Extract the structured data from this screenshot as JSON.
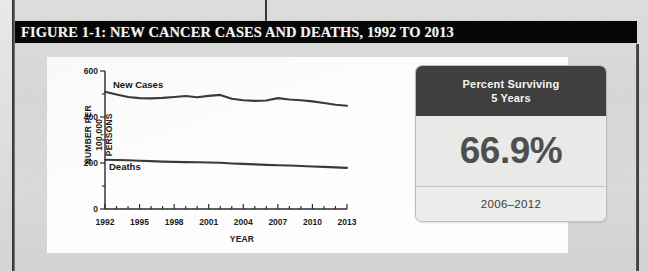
{
  "figure": {
    "title": "FIGURE 1-1: NEW CANCER CASES AND DEATHS, 1992 TO 2013"
  },
  "survival_card": {
    "header_line1": "Percent Surviving",
    "header_line2": "5 Years",
    "value": "66.9%",
    "period": "2006–2012"
  },
  "chart_data": {
    "type": "line",
    "title": "",
    "xlabel": "YEAR",
    "ylabel": "NUMBER PER 100,000 PERSONS",
    "ylim": [
      0,
      600
    ],
    "yticks": [
      0,
      200,
      400,
      600
    ],
    "ytick_labels": [
      "0",
      "200",
      "400",
      "600"
    ],
    "xlim": [
      1992,
      2013
    ],
    "xticks": [
      1992,
      1995,
      1998,
      2001,
      2004,
      2007,
      2010,
      2013
    ],
    "xtick_labels": [
      "1992",
      "1995",
      "1998",
      "2001",
      "2004",
      "2007",
      "2010",
      "2013"
    ],
    "minor_xticks_every": 1,
    "grid": false,
    "legend": "inline-labels",
    "x": [
      1992,
      1993,
      1994,
      1995,
      1996,
      1997,
      1998,
      1999,
      2000,
      2001,
      2002,
      2003,
      2004,
      2005,
      2006,
      2007,
      2008,
      2009,
      2010,
      2011,
      2012,
      2013
    ],
    "series": [
      {
        "name": "New Cases",
        "label": "New Cases",
        "color": "#3a3a3a",
        "values": [
          510,
          498,
          487,
          482,
          481,
          483,
          487,
          491,
          486,
          492,
          496,
          479,
          473,
          470,
          472,
          482,
          476,
          473,
          468,
          461,
          453,
          449
        ]
      },
      {
        "name": "Deaths",
        "label": "Deaths",
        "color": "#3a3a3a",
        "values": [
          214,
          213,
          212,
          210,
          208,
          206,
          205,
          204,
          203,
          202,
          201,
          198,
          196,
          194,
          192,
          190,
          189,
          187,
          185,
          183,
          181,
          179
        ]
      }
    ]
  }
}
